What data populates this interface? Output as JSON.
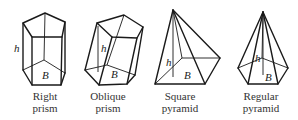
{
  "figures": [
    {
      "id": "right-prism",
      "caption_line1": "Right",
      "caption_line2": "prism",
      "height_label": "h",
      "base_label": "B"
    },
    {
      "id": "oblique-prism",
      "caption_line1": "Oblique",
      "caption_line2": "prism",
      "height_label": "h",
      "base_label": "B"
    },
    {
      "id": "square-pyramid",
      "caption_line1": "Square",
      "caption_line2": "pyramid",
      "height_label": "h",
      "base_label": "B"
    },
    {
      "id": "regular-pyramid",
      "caption_line1": "Regular",
      "caption_line2": "pyramid",
      "height_label": "h",
      "base_label": "B"
    }
  ]
}
